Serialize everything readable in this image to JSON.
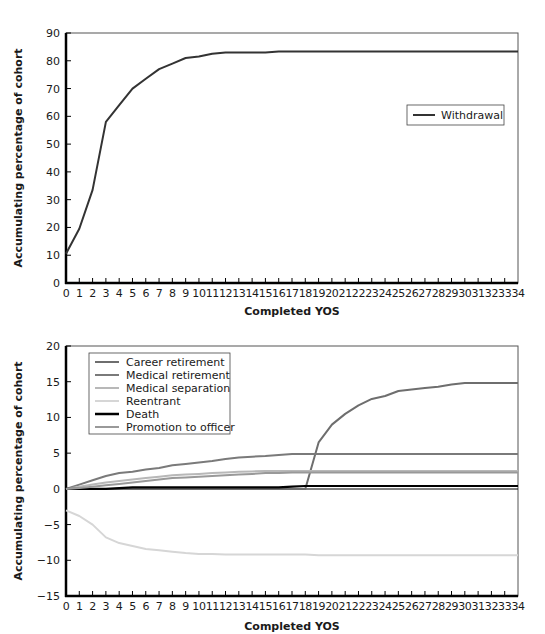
{
  "chart_data": [
    {
      "type": "line",
      "title": "",
      "xlabel": "Completed YOS",
      "ylabel": "Accumulating percentage of cohort",
      "x": [
        0,
        1,
        2,
        3,
        4,
        5,
        6,
        7,
        8,
        9,
        10,
        11,
        12,
        13,
        14,
        15,
        16,
        17,
        18,
        19,
        20,
        21,
        22,
        23,
        24,
        25,
        26,
        27,
        28,
        29,
        30,
        31,
        32,
        33,
        34
      ],
      "xlim": [
        0,
        34
      ],
      "ylim": [
        0,
        90
      ],
      "yticks": [
        0,
        10,
        20,
        30,
        40,
        50,
        60,
        70,
        80,
        90
      ],
      "grid": false,
      "legend_position": "right-middle",
      "series": [
        {
          "name": "Withdrawal",
          "color": "#333333",
          "values": [
            10.5,
            19.5,
            33.5,
            58,
            64,
            70,
            73.5,
            77,
            79,
            81,
            81.5,
            82.5,
            83,
            83,
            83,
            83,
            83.3,
            83.3,
            83.3,
            83.3,
            83.3,
            83.3,
            83.3,
            83.3,
            83.3,
            83.3,
            83.3,
            83.3,
            83.3,
            83.3,
            83.3,
            83.3,
            83.3,
            83.3,
            83.3
          ]
        }
      ]
    },
    {
      "type": "line",
      "title": "",
      "xlabel": "Completed YOS",
      "ylabel": "Accumulating percentage of cohort",
      "x": [
        0,
        1,
        2,
        3,
        4,
        5,
        6,
        7,
        8,
        9,
        10,
        11,
        12,
        13,
        14,
        15,
        16,
        17,
        18,
        19,
        20,
        21,
        22,
        23,
        24,
        25,
        26,
        27,
        28,
        29,
        30,
        31,
        32,
        33,
        34
      ],
      "xlim": [
        0,
        34
      ],
      "ylim": [
        -15,
        20
      ],
      "yticks": [
        -15,
        -10,
        -5,
        0,
        5,
        10,
        15,
        20
      ],
      "grid": false,
      "legend_position": "upper-left",
      "series": [
        {
          "name": "Career retirement",
          "color": "#6e6e6e",
          "values": [
            0,
            0,
            0,
            0,
            0,
            0,
            0,
            0,
            0,
            0,
            0,
            0,
            0,
            0,
            0,
            0,
            0,
            0,
            0,
            6.5,
            9,
            10.5,
            11.7,
            12.6,
            13,
            13.7,
            13.9,
            14.1,
            14.3,
            14.6,
            14.8,
            14.8,
            14.8,
            14.8,
            14.8
          ]
        },
        {
          "name": "Medical retirement",
          "color": "#7a7a7a",
          "values": [
            0,
            0.6,
            1.2,
            1.8,
            2.2,
            2.4,
            2.7,
            2.9,
            3.3,
            3.5,
            3.7,
            3.9,
            4.2,
            4.4,
            4.5,
            4.6,
            4.75,
            4.9,
            4.9,
            4.9,
            4.9,
            4.9,
            4.9,
            4.9,
            4.9,
            4.9,
            4.9,
            4.9,
            4.9,
            4.9,
            4.9,
            4.9,
            4.9,
            4.9,
            4.9
          ]
        },
        {
          "name": "Medical separation",
          "color": "#b8b8b8",
          "values": [
            0,
            0.3,
            0.6,
            0.9,
            1.1,
            1.3,
            1.5,
            1.7,
            1.9,
            2.0,
            2.1,
            2.2,
            2.3,
            2.4,
            2.45,
            2.5,
            2.5,
            2.5,
            2.5,
            2.5,
            2.5,
            2.5,
            2.5,
            2.5,
            2.5,
            2.5,
            2.5,
            2.5,
            2.5,
            2.5,
            2.5,
            2.5,
            2.5,
            2.5,
            2.5
          ]
        },
        {
          "name": "Reentrant",
          "color": "#d6d6d6",
          "values": [
            -3,
            -3.8,
            -5,
            -6.8,
            -7.6,
            -8,
            -8.4,
            -8.6,
            -8.8,
            -9,
            -9.1,
            -9.1,
            -9.2,
            -9.2,
            -9.2,
            -9.2,
            -9.2,
            -9.2,
            -9.2,
            -9.3,
            -9.3,
            -9.3,
            -9.3,
            -9.3,
            -9.3,
            -9.3,
            -9.3,
            -9.3,
            -9.3,
            -9.3,
            -9.3,
            -9.3,
            -9.3,
            -9.3,
            -9.3
          ]
        },
        {
          "name": "Death",
          "color": "#000000",
          "values": [
            0,
            0,
            0,
            0,
            0.1,
            0.2,
            0.2,
            0.2,
            0.2,
            0.2,
            0.2,
            0.2,
            0.2,
            0.2,
            0.2,
            0.2,
            0.2,
            0.3,
            0.4,
            0.4,
            0.4,
            0.4,
            0.4,
            0.4,
            0.4,
            0.4,
            0.4,
            0.4,
            0.4,
            0.4,
            0.4,
            0.4,
            0.4,
            0.4,
            0.4
          ]
        },
        {
          "name": "Promotion to officer",
          "color": "#999999",
          "values": [
            0,
            0.1,
            0.3,
            0.5,
            0.7,
            0.9,
            1.1,
            1.3,
            1.5,
            1.6,
            1.7,
            1.8,
            1.9,
            2.0,
            2.1,
            2.2,
            2.2,
            2.3,
            2.3,
            2.3,
            2.3,
            2.3,
            2.3,
            2.3,
            2.3,
            2.3,
            2.3,
            2.3,
            2.3,
            2.3,
            2.3,
            2.3,
            2.3,
            2.3,
            2.3
          ]
        }
      ]
    }
  ],
  "charts": {
    "top": {
      "ylabel": "Accumulating percentage of cohort",
      "xlabel": "Completed YOS",
      "legend": [
        "Withdrawal"
      ]
    },
    "bottom": {
      "ylabel": "Accumulating percentage of cohort",
      "xlabel": "Completed YOS",
      "legend": [
        "Career retirement",
        "Medical retirement",
        "Medical separation",
        "Reentrant",
        "Death",
        "Promotion to officer"
      ]
    }
  }
}
